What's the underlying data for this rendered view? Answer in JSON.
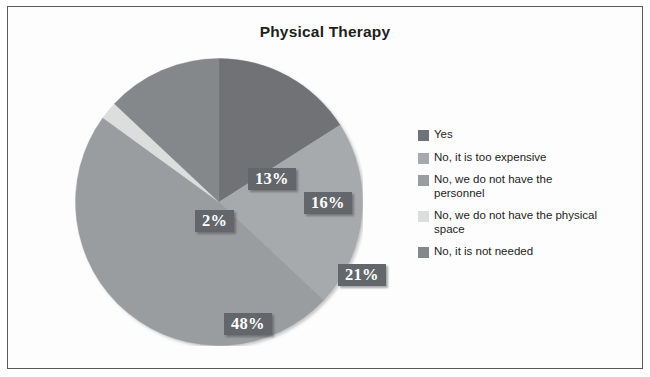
{
  "chart_data": {
    "type": "pie",
    "title": "Physical Therapy",
    "xlabel": "",
    "ylabel": "",
    "legend_position": "right",
    "grid": false,
    "categories": [
      "Yes",
      "No, it is too expensive",
      "No, we do not have the personnel",
      "No, we do not have the physical space",
      "No, it is not needed"
    ],
    "values": [
      16,
      21,
      48,
      2,
      13
    ],
    "value_labels": [
      "16%",
      "21%",
      "48%",
      "2%",
      "13%"
    ],
    "colors": [
      "#6f7276",
      "#a7aaac",
      "#9a9d9f",
      "#dcdedd",
      "#85888b"
    ],
    "slices": [
      {
        "label": "Yes",
        "value": 16,
        "display": "16%",
        "color": "#6f7276",
        "start_deg": 0,
        "sweep_deg": 57.6
      },
      {
        "label": "No, it is too expensive",
        "value": 21,
        "display": "21%",
        "color": "#a7aaac",
        "start_deg": 57.6,
        "sweep_deg": 75.6
      },
      {
        "label": "No, we do not have the personnel",
        "value": 48,
        "display": "48%",
        "color": "#9a9d9f",
        "start_deg": 133.2,
        "sweep_deg": 172.8
      },
      {
        "label": "No, we do not have the physical space",
        "value": 2,
        "display": "2%",
        "color": "#dcdedd",
        "start_deg": 306.0,
        "sweep_deg": 7.2
      },
      {
        "label": "No, it is not needed",
        "value": 13,
        "display": "13%",
        "color": "#85888b",
        "start_deg": 313.2,
        "sweep_deg": 46.8
      }
    ]
  },
  "chart": {
    "title": "Physical Therapy"
  },
  "labels": {
    "pct_yes": "16%",
    "pct_too_expensive": "21%",
    "pct_personnel": "48%",
    "pct_physical_space": "2%",
    "pct_not_needed": "13%"
  },
  "legend": {
    "items": [
      {
        "label": "Yes",
        "color": "#6f7276"
      },
      {
        "label": "No, it is too expensive",
        "color": "#a7aaac"
      },
      {
        "label": "No, we do not have the personnel",
        "color": "#9a9d9f"
      },
      {
        "label": "No, we do not have the physical space",
        "color": "#dcdedd"
      },
      {
        "label": "No, it is not needed",
        "color": "#85888b"
      }
    ]
  }
}
